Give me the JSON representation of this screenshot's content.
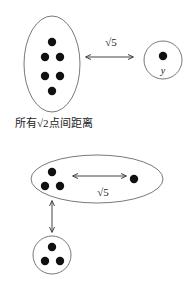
{
  "diagram_top": {
    "group_label": "所有√2点间距离",
    "edge_label": "√5",
    "single_node_label": "y",
    "group_dot_count": 6
  },
  "diagram_bottom": {
    "edge_label": "√5",
    "cluster_dot_count": 3,
    "lower_cluster_dot_count": 3
  },
  "colors": {
    "dot": "#111111",
    "stroke": "#555555",
    "arrow": "#444444"
  }
}
